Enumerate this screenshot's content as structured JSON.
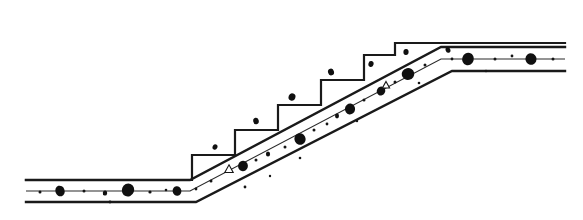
{
  "figure": {
    "title": "Concrete slab on stepped subgrade — cross section",
    "type": "line-drawing",
    "canvas": {
      "width": 583,
      "height": 220,
      "background": "#ffffff"
    },
    "ink_color": "#1a1a1a"
  },
  "geometry": {
    "lower_landing": {
      "left_x": 26,
      "top_y": 180,
      "mid_y": 191,
      "bottom_y": 202,
      "bend_x": 190
    },
    "upper_landing": {
      "right_x": 565,
      "top_y": 47,
      "mid_y": 59,
      "bottom_y": 71,
      "bend_x": 441
    },
    "incline": {
      "start_x": 190,
      "start_y": 191,
      "end_x": 441,
      "end_y": 59,
      "run": 251,
      "rise": 132
    },
    "slab_thickness_px": 22,
    "step_count": 6,
    "step_tread_px": 43,
    "step_riser_px": 25,
    "stair_base_y": 180,
    "stair_first_riser_x": 192,
    "stair_top_y": 43,
    "stair_top_x": 395
  },
  "elements": {
    "stair_outline_name": "stepped-subgrade-outline",
    "slab_top_name": "slab-top-edge",
    "slab_bottom_name": "slab-bottom-edge",
    "slab_center_name": "slab-centerline",
    "aggregate_name": "aggregate-particle",
    "aggregate_open_name": "aggregate-particle-void",
    "speck_name": "fines-speck"
  },
  "stair_path": "M 26,180 L 192,180 L 192,155 L 235,155 L 235,130 L 278,130 L 278,105 L 321,105 L 321,80 L 364,80 L 364,55 L 395,55 L 395,43 L 565,43",
  "slab_top_path": "M 26,180 L 190,180 L 441,47 L 565,47",
  "slab_center_path": "M 26,191 L 190,191 L 441,59 L 565,59",
  "slab_bottom_path": "M 26,202 L 196,202 L 452,71 L 565,71",
  "aggregate_particles": [
    {
      "cx": 60,
      "cy": 191,
      "rx": 4.6,
      "ry": 5.4,
      "rot": -18
    },
    {
      "cx": 105,
      "cy": 193,
      "rx": 2.2,
      "ry": 2.6,
      "rot": 10
    },
    {
      "cx": 128,
      "cy": 190,
      "rx": 6.1,
      "ry": 6.6,
      "rot": 22
    },
    {
      "cx": 177,
      "cy": 191,
      "rx": 4.4,
      "ry": 4.8,
      "rot": -8
    },
    {
      "cx": 243,
      "cy": 166,
      "rx": 4.9,
      "ry": 5.2,
      "rot": 14
    },
    {
      "cx": 300,
      "cy": 139,
      "rx": 5.6,
      "ry": 5.9,
      "rot": -25
    },
    {
      "cx": 350,
      "cy": 109,
      "rx": 5.1,
      "ry": 5.5,
      "rot": 8
    },
    {
      "cx": 381,
      "cy": 91,
      "rx": 4.2,
      "ry": 4.6,
      "rot": 30
    },
    {
      "cx": 408,
      "cy": 74,
      "rx": 6.3,
      "ry": 6.0,
      "rot": -12
    },
    {
      "cx": 468,
      "cy": 59,
      "rx": 5.8,
      "ry": 6.2,
      "rot": 18
    },
    {
      "cx": 531,
      "cy": 59,
      "rx": 5.5,
      "ry": 5.9,
      "rot": -20
    },
    {
      "cx": 337,
      "cy": 116,
      "rx": 2.0,
      "ry": 2.4,
      "rot": 0
    },
    {
      "cx": 268,
      "cy": 154,
      "rx": 2.1,
      "ry": 2.5,
      "rot": 0
    }
  ],
  "aggregate_open_particles": [
    {
      "cx": 229,
      "cy": 169,
      "size": 7
    },
    {
      "cx": 386,
      "cy": 85,
      "size": 6
    }
  ],
  "fines_specks": [
    {
      "cx": 40,
      "cy": 192,
      "r": 1.5
    },
    {
      "cx": 84,
      "cy": 191,
      "r": 1.5
    },
    {
      "cx": 150,
      "cy": 192,
      "r": 1.6
    },
    {
      "cx": 166,
      "cy": 190,
      "r": 1.3
    },
    {
      "cx": 196,
      "cy": 189,
      "r": 1.4
    },
    {
      "cx": 211,
      "cy": 181,
      "r": 1.5
    },
    {
      "cx": 256,
      "cy": 160,
      "r": 1.5
    },
    {
      "cx": 285,
      "cy": 147,
      "r": 1.5
    },
    {
      "cx": 314,
      "cy": 130,
      "r": 1.5
    },
    {
      "cx": 327,
      "cy": 124,
      "r": 1.4
    },
    {
      "cx": 364,
      "cy": 100,
      "r": 1.5
    },
    {
      "cx": 395,
      "cy": 82,
      "r": 1.5
    },
    {
      "cx": 425,
      "cy": 65,
      "r": 1.5
    },
    {
      "cx": 452,
      "cy": 59,
      "r": 1.4
    },
    {
      "cx": 495,
      "cy": 59,
      "r": 1.5
    },
    {
      "cx": 512,
      "cy": 56,
      "r": 1.4
    },
    {
      "cx": 553,
      "cy": 59,
      "r": 1.5
    },
    {
      "cx": 110,
      "cy": 202,
      "r": 1.4
    },
    {
      "cx": 245,
      "cy": 187,
      "r": 1.4
    },
    {
      "cx": 300,
      "cy": 158,
      "r": 1.3
    },
    {
      "cx": 419,
      "cy": 83,
      "r": 1.3
    },
    {
      "cx": 486,
      "cy": 71,
      "r": 1.3
    },
    {
      "cx": 357,
      "cy": 121,
      "r": 1.2
    },
    {
      "cx": 270,
      "cy": 176,
      "r": 1.2
    }
  ],
  "scatter_above_steps": [
    {
      "cx": 292,
      "cy": 97,
      "rx": 3.4,
      "ry": 3.8,
      "rot": 20
    },
    {
      "cx": 331,
      "cy": 72,
      "rx": 3.0,
      "ry": 3.4,
      "rot": -15
    },
    {
      "cx": 371,
      "cy": 64,
      "rx": 2.6,
      "ry": 3.0,
      "rot": 12
    },
    {
      "cx": 256,
      "cy": 121,
      "rx": 2.8,
      "ry": 3.2,
      "rot": -10
    },
    {
      "cx": 215,
      "cy": 147,
      "rx": 2.4,
      "ry": 2.8,
      "rot": 25
    },
    {
      "cx": 406,
      "cy": 52,
      "rx": 2.6,
      "ry": 3.0,
      "rot": 5
    },
    {
      "cx": 448,
      "cy": 50,
      "rx": 2.4,
      "ry": 2.8,
      "rot": -20
    }
  ]
}
